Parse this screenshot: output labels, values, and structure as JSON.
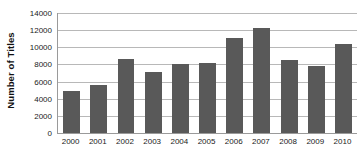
{
  "chart_data": {
    "type": "bar",
    "title": "",
    "xlabel": "",
    "ylabel": "Number of Titles",
    "categories": [
      "2000",
      "2001",
      "2002",
      "2003",
      "2004",
      "2005",
      "2006",
      "2007",
      "2008",
      "2009",
      "2010"
    ],
    "values": [
      4850,
      5650,
      8650,
      7150,
      8050,
      8200,
      11100,
      12300,
      8500,
      7800,
      10350
    ],
    "series": [
      {
        "name": "Number of Titles",
        "values": [
          4850,
          5650,
          8650,
          7150,
          8050,
          8200,
          11100,
          12300,
          8500,
          7800,
          10350
        ]
      }
    ],
    "ylim": [
      0,
      14000
    ],
    "ytick_labels": [
      "0",
      "2000",
      "4000",
      "6000",
      "8000",
      "10000",
      "12000",
      "14000"
    ],
    "ytick_values": [
      0,
      2000,
      4000,
      6000,
      8000,
      10000,
      12000,
      14000
    ],
    "grid": "horizontal",
    "legend": "none",
    "bar_color": "#595959",
    "gridline_color": "#b8b8b8",
    "axis_color": "#9a9a9a",
    "background_color": "#ffffff"
  }
}
